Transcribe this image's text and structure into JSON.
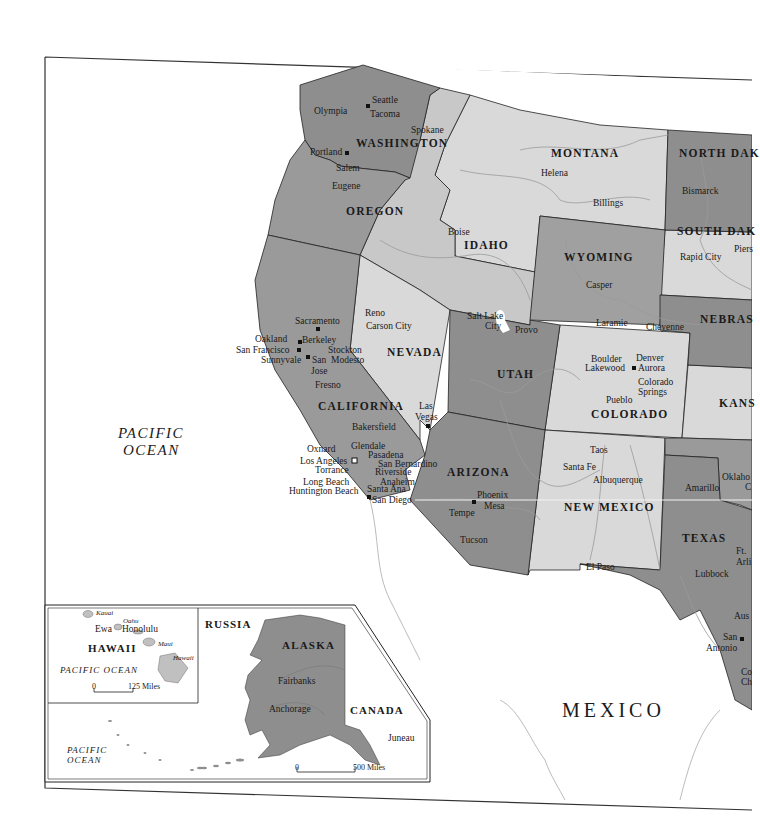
{
  "map": {
    "title": "Western United States",
    "colors": {
      "dark_gray": "#8e8e8e",
      "mid_gray": "#a5a5a5",
      "light_gray": "#d9d9d9",
      "water": "#ffffff",
      "border": "#222222",
      "river": "#9a9a9a"
    },
    "states": {
      "washington": "WASHINGTON",
      "oregon": "OREGON",
      "california": "CALIFORNIA",
      "nevada": "NEVADA",
      "idaho": "IDAHO",
      "montana": "MONTANA",
      "wyoming": "WYOMING",
      "utah": "UTAH",
      "colorado": "COLORADO",
      "arizona": "ARIZONA",
      "new_mexico": "NEW MEXICO",
      "texas": "TEXAS",
      "north_dakota": "NORTH DAK",
      "south_dakota": "SOUTH DAK",
      "nebraska": "NEBRAS",
      "kansas": "KANS",
      "oklahoma": "Oklaho",
      "alaska": "ALASKA",
      "hawaii": "HAWAII"
    },
    "countries": {
      "mexico": "MEXICO",
      "russia": "RUSSIA",
      "canada": "CANADA"
    },
    "oceans": {
      "main_line1": "PACIFIC",
      "main_line2": "OCEAN",
      "hawaii": "PACIFIC OCEAN",
      "alaska_line1": "PACIFIC",
      "alaska_line2": "OCEAN"
    },
    "cities": {
      "seattle": "Seattle",
      "olympia": "Olympia",
      "tacoma": "Tacoma",
      "spokane": "Spokane",
      "portland": "Portland",
      "salem": "Salem",
      "eugene": "Eugene",
      "boise": "Boise",
      "helena": "Helena",
      "billings": "Billings",
      "bismarck": "Bismarck",
      "rapid_city": "Rapid City",
      "pierre": "Piers",
      "casper": "Casper",
      "laramie": "Laramie",
      "cheyenne": "Cheyenne",
      "reno": "Reno",
      "carson_city": "Carson City",
      "las_vegas_1": "Las",
      "las_vegas_2": "Vegas",
      "sacramento": "Sacramento",
      "oakland": "Oakland",
      "berkeley": "Berkeley",
      "san_francisco": "San Francisco",
      "stockton": "Stockton",
      "modesto": "Modesto",
      "sunnyvale": "Sunnyvale",
      "san_jose_1": "San",
      "san_jose_2": "Jose",
      "fresno": "Fresno",
      "bakersfield": "Bakersfield",
      "oxnard": "Oxnard",
      "glendale": "Glendale",
      "pasadena": "Pasadena",
      "los_angeles": "Los Angeles",
      "san_bernardino": "San Bernardino",
      "torrance": "Torrance",
      "riverside": "Riverside",
      "anaheim": "Anaheim",
      "long_beach": "Long Beach",
      "santa_ana": "Santa Ana",
      "huntington_beach": "Huntington Beach",
      "san_diego": "San Diego",
      "salt_lake_city_1": "Salt Lake",
      "salt_lake_city_2": "City",
      "provo": "Provo",
      "boulder": "Boulder",
      "denver": "Denver",
      "lakewood": "Lakewood",
      "aurora": "Aurora",
      "colorado_springs_1": "Colorado",
      "colorado_springs_2": "Springs",
      "pueblo": "Pueblo",
      "taos": "Taos",
      "santa_fe": "Santa Fe",
      "albuquerque": "Albuquerque",
      "el_paso": "El Paso",
      "phoenix": "Phoenix",
      "mesa": "Mesa",
      "tempe": "Tempe",
      "tucson": "Tucson",
      "amarillo": "Amarillo",
      "lubbock": "Lubbock",
      "fort_worth_1": "Ft.",
      "fort_worth_2": "Arli",
      "austin": "Aus",
      "san_antonio_1": "San",
      "san_antonio_2": "Antonio",
      "corpus_1": "Co",
      "corpus_2": "Ch",
      "oklahoma_city": "C",
      "fairbanks": "Fairbanks",
      "anchorage": "Anchorage",
      "juneau": "Juneau",
      "ewa": "Ewa",
      "honolulu": "Honolulu"
    },
    "islands": {
      "kauai": "Kauai",
      "oahu": "Oahu",
      "maui": "Maui",
      "hawaii": "Hawaii"
    },
    "scales": {
      "hawaii_zero": "0",
      "hawaii_distance": "125 Miles",
      "alaska_zero": "0",
      "alaska_distance": "500 Miles"
    }
  }
}
